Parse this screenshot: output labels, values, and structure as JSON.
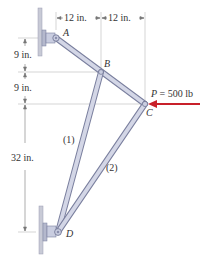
{
  "dimensions": {
    "horizontal": [
      {
        "label": "12 in."
      },
      {
        "label": "12 in."
      }
    ],
    "vertical": [
      {
        "label": "9 in."
      },
      {
        "label": "9 in."
      },
      {
        "label": "32 in."
      }
    ]
  },
  "points": {
    "A": "A",
    "B": "B",
    "C": "C",
    "D": "D"
  },
  "members": {
    "m1": "(1)",
    "m2": "(2)"
  },
  "load": {
    "label": "P = 500 lb",
    "color": "#c8202a"
  },
  "colors": {
    "member_fill": "#c9cde0",
    "member_stroke": "#7a7f9e",
    "wall": "#c8cad6",
    "dim_line": "#9a9a9a"
  }
}
